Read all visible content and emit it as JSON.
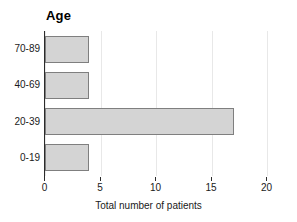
{
  "chart_data": {
    "type": "bar",
    "orientation": "horizontal",
    "title": "Age",
    "xlabel": "Total number of patients",
    "ylabel": "",
    "categories": [
      "0-19",
      "20-39",
      "40-69",
      "70-89"
    ],
    "values": [
      4,
      17,
      4,
      4
    ],
    "xlim": [
      0,
      20
    ],
    "xticks": [
      0,
      5,
      10,
      15,
      20
    ],
    "xtick_labels": [
      "0",
      "5",
      "10",
      "15",
      "20"
    ],
    "grid": "vertical",
    "legend": "none",
    "bar_fill_color": "#d4d4d4",
    "bar_border_color": "#7f7f7f",
    "gridline_color": "#e8e8e8",
    "axis_color": "#2b2b2b",
    "background_color": "#ffffff"
  },
  "axis": {
    "x_title": "Total number of patients",
    "tick_0": "0",
    "tick_1": "5",
    "tick_2": "10",
    "tick_3": "15",
    "tick_4": "20"
  },
  "categories": {
    "row_0": "70-89",
    "row_1": "40-69",
    "row_2": "20-39",
    "row_3": "0-19"
  },
  "title": {
    "text": "Age"
  }
}
